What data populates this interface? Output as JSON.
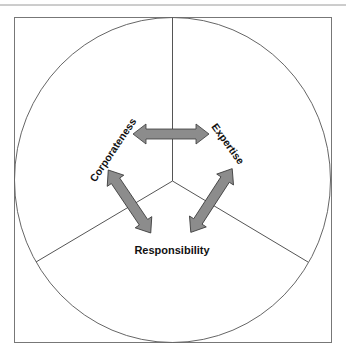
{
  "diagram": {
    "type": "triangular-relationship",
    "labels": {
      "top_left": "Corporateness",
      "top_right": "Expertise",
      "bottom": "Responsibility"
    },
    "arrows": [
      {
        "from": "Corporateness",
        "to": "Expertise",
        "style": "double-headed"
      },
      {
        "from": "Corporateness",
        "to": "Responsibility",
        "style": "double-headed"
      },
      {
        "from": "Expertise",
        "to": "Responsibility",
        "style": "double-headed"
      }
    ],
    "colors": {
      "arrow_fill": "#8c8c8c",
      "arrow_stroke": "#3a3a3a",
      "line": "#555555",
      "text": "#111111",
      "background": "#ffffff"
    }
  }
}
